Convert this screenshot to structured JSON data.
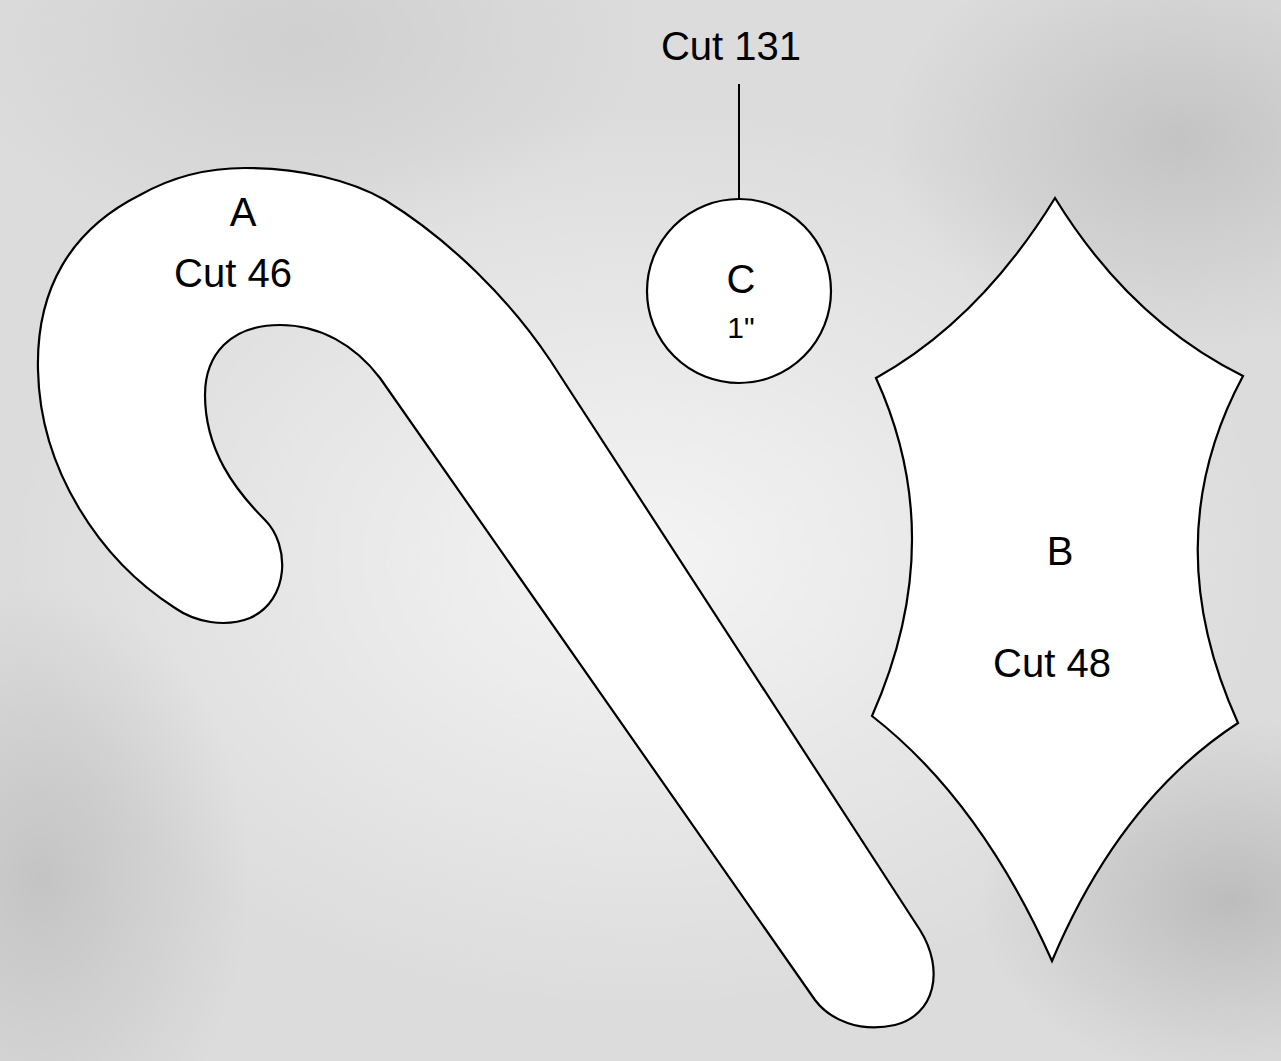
{
  "diagram": {
    "type": "applique pattern template",
    "background": "grey textured paper",
    "pieces": [
      {
        "id": "A",
        "shape": "candy cane",
        "letter": "A",
        "cut_label": "Cut 46"
      },
      {
        "id": "B",
        "shape": "holly leaf",
        "letter": "B",
        "cut_label": "Cut 48"
      },
      {
        "id": "C",
        "shape": "circle (berry)",
        "letter": "C",
        "size_label": "1\"",
        "cut_label": "Cut 131",
        "callout": "arrow pointing down from label to circle"
      }
    ]
  },
  "colors": {
    "outline": "#000000",
    "piece_fill": "#ffffff",
    "background": "#e2e2e2"
  }
}
